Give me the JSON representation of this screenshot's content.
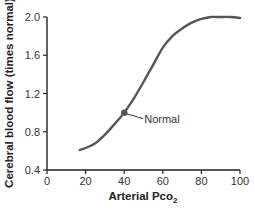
{
  "chart_data": {
    "type": "line",
    "title": "",
    "xlabel": "Arterial Pco",
    "xlabel_subscript": "2",
    "ylabel": "Cerebral blood flow (times normal)",
    "xlim": [
      0,
      100
    ],
    "ylim": [
      0.4,
      2.0
    ],
    "xticks": [
      0,
      20,
      40,
      60,
      80,
      100
    ],
    "xtick_labels": [
      "0",
      "20",
      "40",
      "60",
      "80",
      "100"
    ],
    "yticks": [
      0.4,
      0.8,
      1.2,
      1.6,
      2.0
    ],
    "ytick_labels": [
      "0.4",
      "0.8",
      "1.2",
      "1.6",
      "2.0"
    ],
    "grid": false,
    "legend": null,
    "series": [
      {
        "name": "Cerebral blood flow",
        "color": "#555555",
        "x": [
          17,
          20,
          25,
          30,
          35,
          40,
          45,
          50,
          55,
          60,
          65,
          70,
          75,
          80,
          85,
          90,
          95,
          100
        ],
        "y": [
          0.61,
          0.63,
          0.68,
          0.77,
          0.88,
          1.0,
          1.15,
          1.32,
          1.5,
          1.68,
          1.8,
          1.88,
          1.94,
          1.98,
          2.0,
          2.0,
          2.0,
          1.99
        ]
      }
    ],
    "annotations": [
      {
        "label": "Normal",
        "x": 40,
        "y": 1.0,
        "marker": "dot"
      }
    ]
  }
}
